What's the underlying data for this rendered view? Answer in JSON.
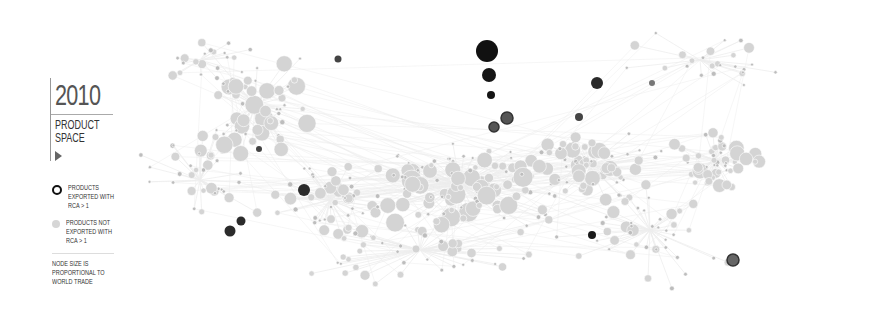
{
  "header": {
    "year": "2010",
    "title_line1": "PRODUCT",
    "title_line2": "SPACE",
    "play_icon": "play-triangle-icon"
  },
  "legend": {
    "items": [
      {
        "label": "PRODUCTS EXPORTED WITH RCA > 1",
        "style": "dark-ring"
      },
      {
        "label": "PRODUCTS NOT EXPORTED WITH RCA > 1",
        "style": "light-gray-dot"
      }
    ],
    "note": "NODE SIZE IS PROPORTIONAL TO WORLD TRADE"
  },
  "colors": {
    "rca_node": "#1a1a1a",
    "rca_node_mid": "#555555",
    "non_rca_node": "#d4d4d4",
    "non_rca_small": "#bdbdbd",
    "edge": "#ececec",
    "text": "#333333",
    "year_text": "#555555"
  },
  "rca_nodes": [
    {
      "x": 487,
      "y": 51,
      "r": 11,
      "fill": "#111111"
    },
    {
      "x": 489,
      "y": 75,
      "r": 7,
      "fill": "#151515"
    },
    {
      "x": 491,
      "y": 95,
      "r": 4,
      "fill": "#151515"
    },
    {
      "x": 507,
      "y": 118,
      "r": 6,
      "fill": "#555555",
      "stroke": "#333333"
    },
    {
      "x": 494,
      "y": 127,
      "r": 5,
      "fill": "#555555",
      "stroke": "#333333"
    },
    {
      "x": 597,
      "y": 83,
      "r": 6,
      "fill": "#2a2a2a"
    },
    {
      "x": 579,
      "y": 117,
      "r": 4,
      "fill": "#444444"
    },
    {
      "x": 338,
      "y": 59,
      "r": 3.5,
      "fill": "#444444"
    },
    {
      "x": 304,
      "y": 190,
      "r": 6,
      "fill": "#2b2b2b"
    },
    {
      "x": 241,
      "y": 221,
      "r": 4.5,
      "fill": "#2b2b2b"
    },
    {
      "x": 230,
      "y": 231,
      "r": 5.5,
      "fill": "#2b2b2b"
    },
    {
      "x": 259,
      "y": 149,
      "r": 3,
      "fill": "#444444"
    },
    {
      "x": 592,
      "y": 235,
      "r": 4,
      "fill": "#1a1a1a"
    },
    {
      "x": 733,
      "y": 260,
      "r": 6,
      "fill": "#666666",
      "stroke": "#333333"
    },
    {
      "x": 652,
      "y": 83,
      "r": 3,
      "fill": "#777777"
    }
  ]
}
